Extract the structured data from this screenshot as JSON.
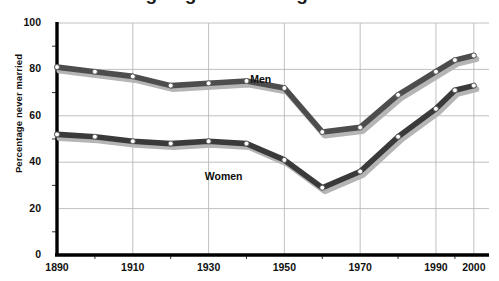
{
  "figure": {
    "title_partial": "Average age at marriage",
    "background": "#ffffff"
  },
  "axes": {
    "ylabel": "Percentage never married",
    "yticks": [
      "0",
      "20",
      "40",
      "60",
      "80",
      "100"
    ],
    "xticks": [
      "1890",
      "1910",
      "1930",
      "1950",
      "1970",
      "1990",
      "2000"
    ],
    "grid_color": "#b9b9b9",
    "axis_color": "#000000"
  },
  "series_labels": {
    "men": "Men",
    "women": "Women"
  },
  "colors": {
    "men_line": "#4d4d4d",
    "women_line": "#3a3a3a",
    "shadow": "#b5b5b5",
    "marker_fill": "#ffffff",
    "marker_stroke": "#555555"
  },
  "chart_data": {
    "type": "line",
    "title": "Percentage never married",
    "xlabel": "",
    "ylabel": "Percentage never married",
    "xlim": [
      1890,
      2004
    ],
    "ylim": [
      0,
      100
    ],
    "grid": true,
    "legend": "inline-labels",
    "x": [
      1890,
      1900,
      1910,
      1920,
      1930,
      1940,
      1950,
      1960,
      1970,
      1980,
      1990,
      1995,
      2000
    ],
    "series": [
      {
        "name": "Men",
        "values": [
          81,
          79,
          77,
          73,
          74,
          75,
          72,
          53,
          55,
          69,
          79,
          84,
          86
        ]
      },
      {
        "name": "Women",
        "values": [
          52,
          51,
          49,
          48,
          49,
          48,
          41,
          29,
          36,
          51,
          63,
          71,
          73
        ]
      }
    ],
    "annotations": [
      {
        "text": "Men",
        "x": 1941,
        "y": 76
      },
      {
        "text": "Women",
        "x": 1929,
        "y": 34
      }
    ]
  }
}
